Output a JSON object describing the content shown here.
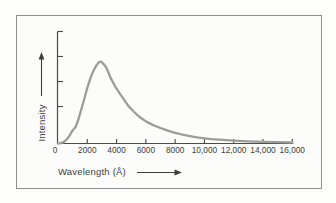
{
  "figure": {
    "background_color": "#fcfcfa",
    "border_color": "#8f8f8f",
    "axis_color": "#4a4a4a",
    "curve_color": "#9c9c9c",
    "text_color": "#3d3d3d"
  },
  "chart_data": {
    "type": "line",
    "title": "",
    "xlabel": "Wavelength (Å)",
    "ylabel": "Intensity",
    "xlim": [
      0,
      16000
    ],
    "ylim": [
      0,
      1.37
    ],
    "grid": false,
    "legend": null,
    "x_ticks": [
      2000,
      4000,
      6000,
      8000,
      10000,
      12000,
      14000,
      16000
    ],
    "x_tick_labels": [
      "0",
      "2000",
      "4000",
      "6000",
      "8000",
      "10,000",
      "12,000",
      "14,000",
      "16,000"
    ],
    "y_tick_fractions": [
      0.33,
      0.553,
      0.777,
      1.0
    ],
    "y_ticks_labeled": false,
    "peak": {
      "wavelength_A": 2900,
      "relative_intensity": 1.0
    },
    "series": [
      {
        "name": "intensity-curve",
        "x": [
          0,
          200,
          400,
          600,
          800,
          1000,
          1200,
          1400,
          1600,
          1800,
          2000,
          2200,
          2400,
          2600,
          2800,
          2950,
          3100,
          3300,
          3600,
          3900,
          4200,
          4500,
          4800,
          5200,
          5600,
          6000,
          6500,
          7000,
          7500,
          8000,
          8500,
          9000,
          9500,
          10000,
          10500,
          11000,
          12000,
          13000,
          14000,
          15000,
          16000
        ],
        "y": [
          0,
          0.005,
          0.02,
          0.05,
          0.1,
          0.16,
          0.2,
          0.3,
          0.42,
          0.55,
          0.68,
          0.79,
          0.88,
          0.95,
          0.995,
          1.0,
          0.975,
          0.93,
          0.8,
          0.7,
          0.615,
          0.54,
          0.46,
          0.385,
          0.32,
          0.27,
          0.225,
          0.19,
          0.158,
          0.13,
          0.108,
          0.09,
          0.075,
          0.063,
          0.054,
          0.046,
          0.034,
          0.026,
          0.02,
          0.016,
          0.012
        ]
      }
    ]
  }
}
